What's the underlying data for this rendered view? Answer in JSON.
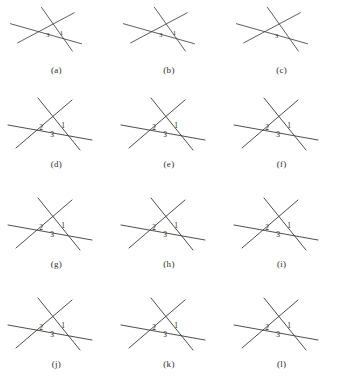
{
  "figure": {
    "type": "geometry-diagram-grid",
    "rows": 4,
    "columns": 3,
    "background_color": "#ffffff",
    "line_color": "#3a3a3a",
    "label_color": "#1f1f1f",
    "angle_labels": [
      "1",
      "2",
      "3"
    ],
    "panels": [
      {
        "caption": "(a)",
        "variant": "wide",
        "labels": [
          {
            "text": "3",
            "x": 47,
            "y": 41
          },
          {
            "text": "1",
            "x": 62,
            "y": 38
          }
        ],
        "lines": [
          {
            "x1": 6,
            "y1": 26,
            "x2": 84,
            "y2": 48
          },
          {
            "x1": 14,
            "y1": 47,
            "x2": 76,
            "y2": 14
          },
          {
            "x1": 40,
            "y1": 8,
            "x2": 74,
            "y2": 56
          }
        ]
      },
      {
        "caption": "(b)",
        "variant": "wide",
        "labels": [
          {
            "text": "3",
            "x": 47,
            "y": 41
          },
          {
            "text": "1",
            "x": 62,
            "y": 38
          }
        ],
        "lines": [
          {
            "x1": 6,
            "y1": 26,
            "x2": 84,
            "y2": 48
          },
          {
            "x1": 14,
            "y1": 47,
            "x2": 76,
            "y2": 14
          },
          {
            "x1": 40,
            "y1": 8,
            "x2": 74,
            "y2": 56
          }
        ]
      },
      {
        "caption": "(c)",
        "variant": "wide",
        "labels": [
          {
            "text": "3",
            "x": 50,
            "y": 42
          }
        ],
        "lines": [
          {
            "x1": 6,
            "y1": 26,
            "x2": 84,
            "y2": 48
          },
          {
            "x1": 14,
            "y1": 47,
            "x2": 76,
            "y2": 14
          },
          {
            "x1": 40,
            "y1": 8,
            "x2": 74,
            "y2": 56
          }
        ]
      },
      {
        "caption": "(d)",
        "variant": "triangle",
        "labels": [
          {
            "text": "2",
            "x": 41,
            "y": 40
          },
          {
            "text": "1",
            "x": 63,
            "y": 38
          },
          {
            "text": "3",
            "x": 52,
            "y": 47
          }
        ],
        "lines": [
          {
            "x1": 8,
            "y1": 35,
            "x2": 92,
            "y2": 50
          },
          {
            "x1": 16,
            "y1": 58,
            "x2": 72,
            "y2": 10
          },
          {
            "x1": 38,
            "y1": 8,
            "x2": 80,
            "y2": 60
          }
        ]
      },
      {
        "caption": "(e)",
        "variant": "triangle",
        "labels": [
          {
            "text": "2",
            "x": 41,
            "y": 40
          },
          {
            "text": "1",
            "x": 63,
            "y": 38
          },
          {
            "text": "3",
            "x": 52,
            "y": 47
          }
        ],
        "lines": [
          {
            "x1": 8,
            "y1": 35,
            "x2": 92,
            "y2": 50
          },
          {
            "x1": 16,
            "y1": 58,
            "x2": 72,
            "y2": 10
          },
          {
            "x1": 38,
            "y1": 8,
            "x2": 80,
            "y2": 60
          }
        ]
      },
      {
        "caption": "(f)",
        "variant": "triangle",
        "labels": [
          {
            "text": "2",
            "x": 41,
            "y": 40
          },
          {
            "text": "1",
            "x": 63,
            "y": 38
          },
          {
            "text": "3",
            "x": 52,
            "y": 47
          }
        ],
        "lines": [
          {
            "x1": 8,
            "y1": 35,
            "x2": 92,
            "y2": 50
          },
          {
            "x1": 16,
            "y1": 58,
            "x2": 72,
            "y2": 10
          },
          {
            "x1": 38,
            "y1": 8,
            "x2": 80,
            "y2": 60
          }
        ]
      },
      {
        "caption": "(g)",
        "variant": "triangle",
        "labels": [
          {
            "text": "2",
            "x": 41,
            "y": 40
          },
          {
            "text": "1",
            "x": 63,
            "y": 38
          },
          {
            "text": "3",
            "x": 52,
            "y": 47
          }
        ],
        "lines": [
          {
            "x1": 8,
            "y1": 35,
            "x2": 92,
            "y2": 50
          },
          {
            "x1": 16,
            "y1": 58,
            "x2": 72,
            "y2": 10
          },
          {
            "x1": 38,
            "y1": 8,
            "x2": 80,
            "y2": 60
          }
        ]
      },
      {
        "caption": "(h)",
        "variant": "triangle",
        "labels": [
          {
            "text": "2",
            "x": 41,
            "y": 40
          },
          {
            "text": "1",
            "x": 63,
            "y": 38
          },
          {
            "text": "3",
            "x": 52,
            "y": 47
          }
        ],
        "lines": [
          {
            "x1": 8,
            "y1": 35,
            "x2": 92,
            "y2": 50
          },
          {
            "x1": 16,
            "y1": 58,
            "x2": 72,
            "y2": 10
          },
          {
            "x1": 38,
            "y1": 8,
            "x2": 80,
            "y2": 60
          }
        ]
      },
      {
        "caption": "(i)",
        "variant": "triangle",
        "labels": [
          {
            "text": "2",
            "x": 41,
            "y": 40
          },
          {
            "text": "1",
            "x": 63,
            "y": 38
          },
          {
            "text": "3",
            "x": 52,
            "y": 47
          }
        ],
        "lines": [
          {
            "x1": 8,
            "y1": 35,
            "x2": 92,
            "y2": 50
          },
          {
            "x1": 16,
            "y1": 58,
            "x2": 72,
            "y2": 10
          },
          {
            "x1": 38,
            "y1": 8,
            "x2": 80,
            "y2": 60
          }
        ]
      },
      {
        "caption": "(j)",
        "variant": "triangle",
        "labels": [
          {
            "text": "2",
            "x": 41,
            "y": 40
          },
          {
            "text": "1",
            "x": 63,
            "y": 38
          },
          {
            "text": "3",
            "x": 52,
            "y": 47
          }
        ],
        "lines": [
          {
            "x1": 8,
            "y1": 35,
            "x2": 92,
            "y2": 50
          },
          {
            "x1": 16,
            "y1": 58,
            "x2": 72,
            "y2": 10
          },
          {
            "x1": 38,
            "y1": 8,
            "x2": 80,
            "y2": 60
          }
        ]
      },
      {
        "caption": "(k)",
        "variant": "triangle",
        "labels": [
          {
            "text": "2",
            "x": 41,
            "y": 40
          },
          {
            "text": "1",
            "x": 63,
            "y": 38
          },
          {
            "text": "3",
            "x": 52,
            "y": 47
          }
        ],
        "lines": [
          {
            "x1": 8,
            "y1": 35,
            "x2": 92,
            "y2": 50
          },
          {
            "x1": 16,
            "y1": 58,
            "x2": 72,
            "y2": 10
          },
          {
            "x1": 38,
            "y1": 8,
            "x2": 80,
            "y2": 60
          }
        ]
      },
      {
        "caption": "(l)",
        "variant": "triangle",
        "labels": [
          {
            "text": "2",
            "x": 41,
            "y": 40
          },
          {
            "text": "1",
            "x": 63,
            "y": 38
          },
          {
            "text": "3",
            "x": 52,
            "y": 47
          }
        ],
        "lines": [
          {
            "x1": 8,
            "y1": 35,
            "x2": 92,
            "y2": 50
          },
          {
            "x1": 16,
            "y1": 58,
            "x2": 72,
            "y2": 10
          },
          {
            "x1": 38,
            "y1": 8,
            "x2": 80,
            "y2": 60
          }
        ]
      }
    ]
  }
}
